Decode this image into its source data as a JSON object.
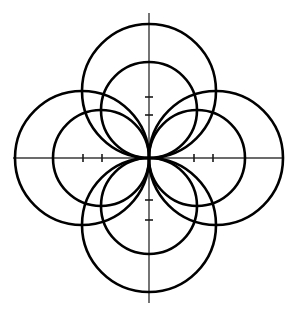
{
  "figure": {
    "background_color": "#ffffff",
    "curve_color": "#000000",
    "axis_color": "#3a3a3a",
    "tick_color": "#1a1a1a",
    "width": 293,
    "height": 320
  },
  "axes": {
    "origin": {
      "x": 149,
      "y": 158
    },
    "x_axis": {
      "x1": 13,
      "y1": 158,
      "x2": 283,
      "y2": 158,
      "label": "x-axis"
    },
    "y_axis": {
      "x1": 149,
      "y1": 13,
      "x2": 149,
      "y2": 303,
      "label": "y-axis"
    },
    "tick_length": 8,
    "ticks_x": [
      {
        "x": 83,
        "value": -2
      },
      {
        "x": 102,
        "value": -1
      },
      {
        "x": 194,
        "value": 1
      },
      {
        "x": 213,
        "value": 2
      }
    ],
    "ticks_y": [
      {
        "y": 97,
        "value": 2
      },
      {
        "y": 115,
        "value": 1
      },
      {
        "y": 200,
        "value": -1
      },
      {
        "y": 220,
        "value": -2
      }
    ]
  },
  "chart_data": {
    "type": "diagram",
    "origin": {
      "x": 149,
      "y": 158
    },
    "radius_large": 67,
    "radius_small": 48,
    "circles": [
      {
        "name": "large-top",
        "cx": 149,
        "cy": 91,
        "r": 67,
        "direction": "up"
      },
      {
        "name": "large-bottom",
        "cx": 149,
        "cy": 225,
        "r": 67,
        "direction": "down"
      },
      {
        "name": "large-left",
        "cx": 82,
        "cy": 158,
        "r": 67,
        "direction": "left"
      },
      {
        "name": "large-right",
        "cx": 216,
        "cy": 158,
        "r": 67,
        "direction": "right"
      },
      {
        "name": "small-top",
        "cx": 149,
        "cy": 110,
        "r": 48,
        "direction": "up"
      },
      {
        "name": "small-bottom",
        "cx": 149,
        "cy": 206,
        "r": 48,
        "direction": "down"
      },
      {
        "name": "small-left",
        "cx": 101,
        "cy": 158,
        "r": 48,
        "direction": "left"
      },
      {
        "name": "small-right",
        "cx": 197,
        "cy": 158,
        "r": 48,
        "direction": "right"
      }
    ],
    "grid": false,
    "legend": false,
    "xlabel": "",
    "ylabel": ""
  }
}
